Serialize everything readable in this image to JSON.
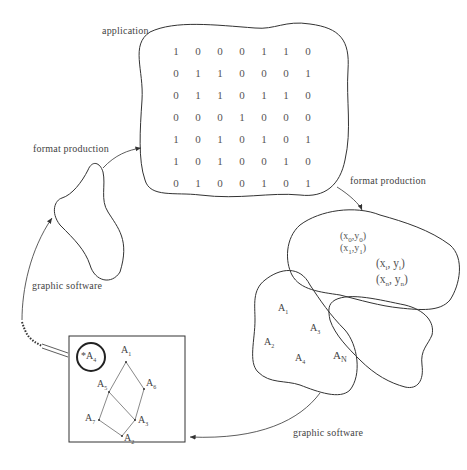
{
  "labels": {
    "application": "application",
    "format_production_left": "format production",
    "format_production_right": "format production",
    "graphic_software_left": "graphic software",
    "graphic_software_bottom": "graphic software"
  },
  "matrix": {
    "rows": [
      [
        "1",
        "0",
        "0",
        "0",
        "1",
        "1",
        "0"
      ],
      [
        "0",
        "1",
        "1",
        "0",
        "0",
        "0",
        "1"
      ],
      [
        "0",
        "1",
        "1",
        "0",
        "1",
        "1",
        "0"
      ],
      [
        "0",
        "0",
        "0",
        "1",
        "0",
        "0",
        "0"
      ],
      [
        "1",
        "0",
        "1",
        "0",
        "1",
        "0",
        "1"
      ],
      [
        "1",
        "0",
        "1",
        "0",
        "0",
        "1",
        "0"
      ],
      [
        "0",
        "1",
        "0",
        "0",
        "1",
        "0",
        "1"
      ]
    ]
  },
  "coordinates": [
    {
      "base": "(x",
      "sub": "0",
      "mid": ",y",
      "sub2": "0",
      "end": ")"
    },
    {
      "base": "(x",
      "sub": "1",
      "mid": ",y",
      "sub2": "1",
      "end": ")"
    },
    {
      "base": "(x",
      "sub": "i",
      "mid": ", y",
      "sub2": "i",
      "end": ")"
    },
    {
      "base": "(x",
      "sub": "n",
      "mid": ", y",
      "sub2": "n",
      "end": ")"
    }
  ],
  "region_nodes": [
    {
      "base": "A",
      "sub": "1"
    },
    {
      "base": "A",
      "sub": "3"
    },
    {
      "base": "A",
      "sub": "2"
    },
    {
      "base": "A",
      "sub": "4"
    },
    {
      "base": "A",
      "sub": "N"
    }
  ],
  "graph_nodes": [
    {
      "id": "A4",
      "base": "*A",
      "sub": "4",
      "circled": true
    },
    {
      "id": "A1",
      "base": "A",
      "sub": "1"
    },
    {
      "id": "A5",
      "base": "A",
      "sub": "5"
    },
    {
      "id": "A6",
      "base": "A",
      "sub": "6"
    },
    {
      "id": "A7",
      "base": "A",
      "sub": "7"
    },
    {
      "id": "A3",
      "base": "A",
      "sub": "3"
    },
    {
      "id": "A2",
      "base": "A",
      "sub": "2"
    }
  ],
  "graph_edges": [
    [
      "A1",
      "A5"
    ],
    [
      "A1",
      "A6"
    ],
    [
      "A5",
      "A7"
    ],
    [
      "A5",
      "A3"
    ],
    [
      "A6",
      "A3"
    ],
    [
      "A7",
      "A2"
    ],
    [
      "A3",
      "A2"
    ]
  ],
  "colors": {
    "line": "#333333",
    "text": "#444444",
    "background": "#ffffff"
  }
}
